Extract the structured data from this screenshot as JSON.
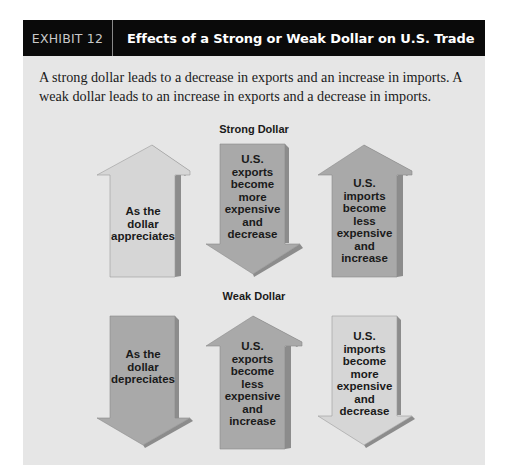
{
  "header": {
    "label": "EXHIBIT 12",
    "title": "Effects of a Strong or Weak Dollar on U.S. Trade"
  },
  "caption": "A strong dollar leads to a decrease in exports and an increase in imports. A weak dollar leads to an increase in exports and a decrease in imports.",
  "strong_dollar": {
    "title": "Strong Dollar",
    "arrows": [
      {
        "direction": "up",
        "shade": "light",
        "lines": [
          "As the",
          "dollar",
          "appreciates"
        ]
      },
      {
        "direction": "down",
        "shade": "dark",
        "lines": [
          "U.S.",
          "exports",
          "become",
          "more",
          "expensive",
          "and",
          "decrease"
        ]
      },
      {
        "direction": "up",
        "shade": "dark",
        "lines": [
          "U.S.",
          "imports",
          "become",
          "less",
          "expensive",
          "and",
          "increase"
        ]
      }
    ]
  },
  "weak_dollar": {
    "title": "Weak Dollar",
    "arrows": [
      {
        "direction": "down",
        "shade": "dark",
        "lines": [
          "As the",
          "dollar",
          "depreciates"
        ]
      },
      {
        "direction": "up",
        "shade": "dark",
        "lines": [
          "U.S.",
          "exports",
          "become",
          "less",
          "expensive",
          "and",
          "increase"
        ]
      },
      {
        "direction": "down",
        "shade": "light",
        "lines": [
          "U.S.",
          "imports",
          "become",
          "more",
          "expensive",
          "and",
          "decrease"
        ]
      }
    ]
  },
  "colors": {
    "header_bg": "#0a0a0a",
    "panel_bg": "#e6e6e6",
    "arrow_light": "#d6d6d6",
    "arrow_dark": "#a9a9a9",
    "arrow_edge": "#8c8c8c"
  }
}
